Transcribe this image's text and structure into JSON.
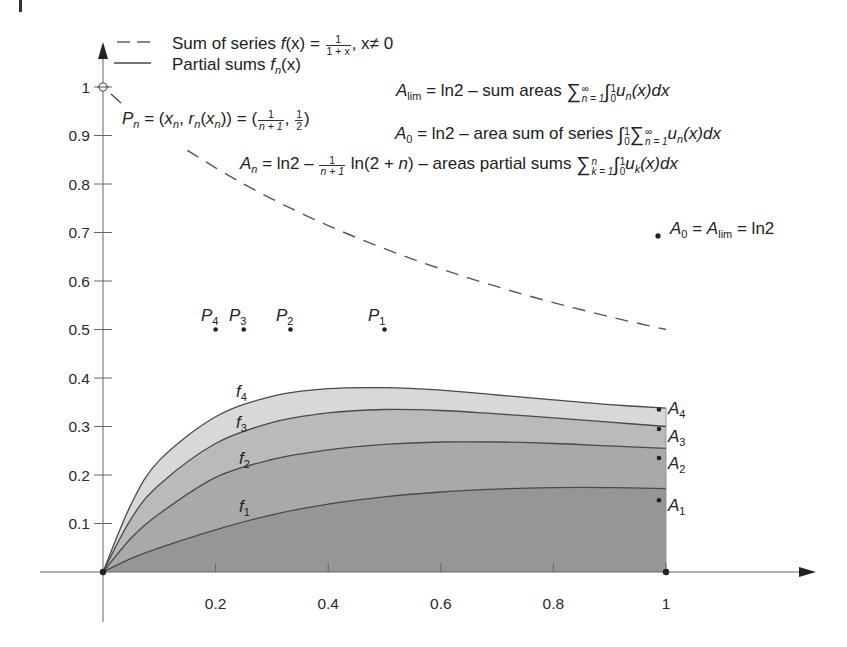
{
  "chart_data": {
    "type": "area",
    "title": "",
    "xlabel": "",
    "ylabel": "",
    "xlim": [
      0,
      1.27
    ],
    "ylim": [
      0,
      1.08
    ],
    "grid": false,
    "x_ticks": [
      0.2,
      0.4,
      0.6,
      0.8,
      1
    ],
    "x_tick_labels": [
      "0.2",
      "0.4",
      "0.6",
      "0.8",
      "1"
    ],
    "y_ticks": [
      0.1,
      0.2,
      0.3,
      0.4,
      0.5,
      0.6,
      0.7,
      0.8,
      0.9,
      1
    ],
    "y_tick_labels": [
      "0.1",
      "0.2",
      "0.3",
      "0.4",
      "0.5",
      "0.6",
      "0.7",
      "0.8",
      "0.9",
      "1"
    ],
    "legend": [
      {
        "style": "dashed",
        "label": "Sum of series f(x) = 1/(1+x), x≠0"
      },
      {
        "style": "solid",
        "label": "Partial sums f_n(x)"
      }
    ],
    "series": [
      {
        "name": "Sum of series f(x)=1/(1+x)",
        "style": "dashed",
        "x": [
          0,
          0.1,
          0.2,
          0.3,
          0.4,
          0.5,
          0.6,
          0.7,
          0.8,
          0.9,
          1
        ],
        "y": [
          1,
          0.909,
          0.833,
          0.769,
          0.714,
          0.667,
          0.625,
          0.588,
          0.556,
          0.526,
          0.5
        ]
      },
      {
        "name": "f1",
        "label": "f1",
        "fill": "#969696",
        "x": [
          0,
          0.05,
          0.1,
          0.2,
          0.3,
          0.4,
          0.5,
          0.6,
          0.7,
          0.8,
          0.9,
          1
        ],
        "y": [
          0,
          0.028,
          0.05,
          0.087,
          0.118,
          0.14,
          0.155,
          0.165,
          0.171,
          0.174,
          0.174,
          0.172
        ]
      },
      {
        "name": "f2",
        "label": "f2",
        "fill": "#a9a9a9",
        "x": [
          0,
          0.05,
          0.1,
          0.2,
          0.3,
          0.4,
          0.5,
          0.6,
          0.7,
          0.8,
          0.9,
          1
        ],
        "y": [
          0,
          0.07,
          0.12,
          0.195,
          0.232,
          0.252,
          0.263,
          0.268,
          0.268,
          0.265,
          0.26,
          0.255
        ]
      },
      {
        "name": "f3",
        "label": "f3",
        "fill": "#bababa",
        "x": [
          0,
          0.05,
          0.1,
          0.2,
          0.3,
          0.4,
          0.5,
          0.6,
          0.7,
          0.8,
          0.9,
          1
        ],
        "y": [
          0,
          0.11,
          0.18,
          0.265,
          0.308,
          0.328,
          0.335,
          0.333,
          0.326,
          0.318,
          0.309,
          0.3
        ]
      },
      {
        "name": "f4",
        "label": "f4",
        "fill": "#d8d8d8",
        "x": [
          0,
          0.05,
          0.1,
          0.2,
          0.3,
          0.4,
          0.5,
          0.6,
          0.7,
          0.8,
          0.9,
          1
        ],
        "y": [
          0,
          0.14,
          0.23,
          0.32,
          0.362,
          0.378,
          0.38,
          0.375,
          0.365,
          0.355,
          0.345,
          0.338
        ]
      }
    ],
    "points": [
      {
        "name": "P1",
        "x": 0.5,
        "y": 0.5
      },
      {
        "name": "P2",
        "x": 0.333,
        "y": 0.5
      },
      {
        "name": "P3",
        "x": 0.25,
        "y": 0.5
      },
      {
        "name": "P4",
        "x": 0.2,
        "y": 0.5
      },
      {
        "name": "A1",
        "x": 1,
        "y": 0.148
      },
      {
        "name": "A2",
        "x": 1,
        "y": 0.235
      },
      {
        "name": "A3",
        "x": 1,
        "y": 0.295
      },
      {
        "name": "A4",
        "x": 1,
        "y": 0.335
      },
      {
        "name": "A0=Alim=ln2",
        "x": 1,
        "y": 0.693
      },
      {
        "name": "open-circle",
        "x": 0,
        "y": 1
      }
    ],
    "annotations": [
      "A_lim = ln2 – sum areas Σ_{n=1}^∞ ∫_0^1 u_n(x)dx",
      "A_0 = ln2 – area sum of series ∫_0^1 Σ_{n=1}^∞ u_n(x)dx",
      "A_n = ln2 – 1/(n+1) ln(2+n) – areas partial sums Σ_{k=1}^n ∫_0^1 u_k(x)dx",
      "P_n = (x_n, r_n(x_n)) = (1/(n+1), 1/2)",
      "A_0 = A_lim = ln2"
    ]
  },
  "legend": {
    "dashed": {
      "pre": "Sum of series ",
      "f": "f",
      "arg": "(x) = ",
      "num": "1",
      "den": "1 + x",
      "post": ", x≠ 0"
    },
    "solid": {
      "pre": "Partial sums ",
      "f": "f",
      "sub": "n",
      "post": "(x)"
    }
  },
  "annotations": {
    "alim": {
      "A": "A",
      "sub": "lim",
      "text1": " = ln2 – sum areas ",
      "sigma": "∑",
      "sig_top": "∞",
      "sig_bot": "n = 1",
      "int": "∫",
      "int_top": "1",
      "int_bot": "0",
      "u": "u",
      "u_sub": "n",
      "tail": "(x)dx"
    },
    "a0": {
      "A": "A",
      "sub": "0",
      "text1": " = ln2 – area sum of series ",
      "int": "∫",
      "int_top": "1",
      "int_bot": "0",
      "sigma": "∑",
      "sig_top": "∞",
      "sig_bot": "n = 1",
      "u": "u",
      "u_sub": "n",
      "tail": "(x)dx"
    },
    "an": {
      "A": "A",
      "sub": "n",
      "text1": " = ln2 – ",
      "num": "1",
      "den": "n + 1",
      "text2": " ln(2 + ",
      "n": "n",
      "text3": ") – areas partial sums ",
      "sigma": "∑",
      "sig_top": "n",
      "sig_bot": "k = 1",
      "int": "∫",
      "int_top": "1",
      "int_bot": "0",
      "u": "u",
      "u_sub": "k",
      "tail": "(x)dx"
    },
    "pn": {
      "P": "P",
      "sub": "n",
      "text1": " = (",
      "x": "x",
      "xs": "n",
      "comma": ", ",
      "r": "r",
      "rs": "n",
      "paren": "(",
      "x2": "x",
      "x2s": "n",
      "close": ")) = (",
      "num1": "1",
      "den1": "n + 1",
      "sep": ", ",
      "num2": "1",
      "den2": "2",
      "end": ")"
    },
    "a0lim": {
      "A": "A",
      "sub0": "0",
      "eq1": " = ",
      "A2": "A",
      "sublim": "lim",
      "eq2": " = ln2"
    }
  },
  "labels": {
    "f1": "f",
    "f1s": "1",
    "f2": "f",
    "f2s": "2",
    "f3": "f",
    "f3s": "3",
    "f4": "f",
    "f4s": "4",
    "A1": "A",
    "A1s": "1",
    "A2": "A",
    "A2s": "2",
    "A3": "A",
    "A3s": "3",
    "A4": "A",
    "A4s": "4",
    "P1": "P",
    "P1s": "1",
    "P2": "P",
    "P2s": "2",
    "P3": "P",
    "P3s": "3",
    "P4": "P",
    "P4s": "4"
  },
  "colors": {
    "axis": "#555555",
    "curve": "#4a4a4a",
    "dashed": "#555555",
    "fill_f1": "#969696",
    "fill_f2": "#a9a9a9",
    "fill_f3": "#bababa",
    "fill_f4": "#d8d8d8"
  }
}
